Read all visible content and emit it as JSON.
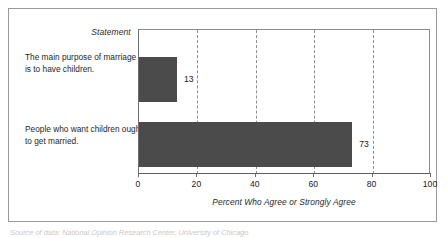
{
  "figure": {
    "statement_header": "Statement",
    "source_note": "Source of data: National Opinion Research Center, University of Chicago"
  },
  "chart_data": {
    "type": "bar",
    "orientation": "horizontal",
    "title": "",
    "xlabel": "Percent Who Agree or Strongly Agree",
    "ylabel": "Statement",
    "categories": [
      "The main purpose of marriage is to have children.",
      "People who want children ought to get married."
    ],
    "values": [
      13,
      73
    ],
    "value_labels": [
      "13",
      "73"
    ],
    "xlim": [
      0,
      100
    ],
    "xticks": [
      0,
      20,
      40,
      60,
      80,
      100
    ],
    "xtick_labels": [
      "0",
      "20",
      "40",
      "60",
      "80",
      "100"
    ],
    "gridlines_at": [
      20,
      40,
      60,
      80
    ],
    "grid": "dashed-vertical",
    "legend": "none",
    "bar_color": "#4b4b4b",
    "frame_color": "#9a9a9a"
  }
}
